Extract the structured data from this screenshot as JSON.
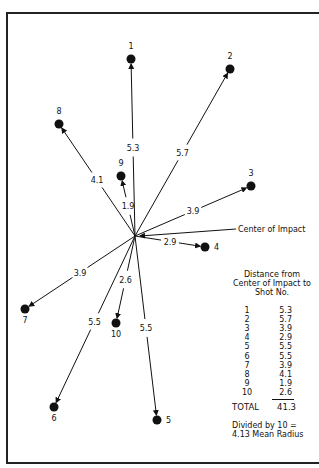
{
  "diagram": {
    "center_label": "Center of Impact",
    "center": {
      "x": 135,
      "y": 236
    },
    "shots": [
      {
        "no": "1",
        "distance": "5.3",
        "x": 131,
        "y": 59
      },
      {
        "no": "2",
        "distance": "5.7",
        "x": 230,
        "y": 69
      },
      {
        "no": "3",
        "distance": "3.9",
        "x": 251,
        "y": 186
      },
      {
        "no": "4",
        "distance": "2.9",
        "x": 205,
        "y": 247
      },
      {
        "no": "5",
        "distance": "5.5",
        "x": 157,
        "y": 420
      },
      {
        "no": "6",
        "distance": "5.5",
        "x": 54,
        "y": 407
      },
      {
        "no": "7",
        "distance": "3.9",
        "x": 25,
        "y": 309
      },
      {
        "no": "8",
        "distance": "4.1",
        "x": 59,
        "y": 124
      },
      {
        "no": "9",
        "distance": "1.9",
        "x": 121,
        "y": 176
      },
      {
        "no": "10",
        "distance": "2.6",
        "x": 116,
        "y": 323
      }
    ]
  },
  "table": {
    "header_line1": "Distance from",
    "header_line2": "Center of Impact to",
    "header_line3": "Shot No.",
    "rows": [
      {
        "no": "1",
        "value": "5.3"
      },
      {
        "no": "2",
        "value": "5.7"
      },
      {
        "no": "3",
        "value": "3.9"
      },
      {
        "no": "4",
        "value": "2.9"
      },
      {
        "no": "5",
        "value": "5.5"
      },
      {
        "no": "6",
        "value": "5.5"
      },
      {
        "no": "7",
        "value": "3.9"
      },
      {
        "no": "8",
        "value": "4.1"
      },
      {
        "no": "9",
        "value": "1.9"
      },
      {
        "no": "10",
        "value": "2.6"
      }
    ],
    "total_label": "TOTAL",
    "total_value": "41.3",
    "footer_line1": "Divided by 10 =",
    "footer_line2": "4.13 Mean Radius"
  }
}
